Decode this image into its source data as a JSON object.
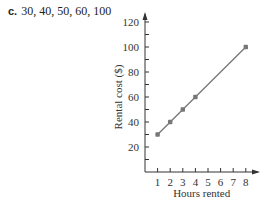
{
  "problem": {
    "letter": "c.",
    "text": "30, 40, 50, 60, 100"
  },
  "chart_data": {
    "type": "line",
    "title": "",
    "xlabel": "Hours rented",
    "ylabel": "Rental cost ($)",
    "x": [
      1,
      2,
      3,
      4,
      8
    ],
    "series": [
      {
        "name": "Rental cost",
        "values": [
          30,
          40,
          50,
          60,
          100
        ],
        "color": "#777777"
      }
    ],
    "x_ticks": [
      1,
      2,
      3,
      4,
      5,
      6,
      7,
      8
    ],
    "y_ticks": [
      20,
      40,
      60,
      80,
      100,
      120
    ],
    "xlim": [
      0,
      9
    ],
    "ylim": [
      0,
      125
    ],
    "grid": false,
    "legend": "none"
  }
}
